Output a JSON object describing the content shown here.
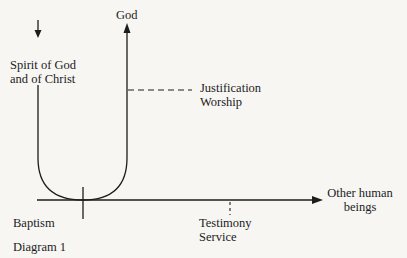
{
  "diagram": {
    "caption": "Diagram 1",
    "labels": {
      "top_arrow": "God",
      "down_arrow_line1": "Spirit of God",
      "down_arrow_line2": "and of Christ",
      "vertical_marker_line1": "Justification",
      "vertical_marker_line2": "Worship",
      "horizontal_arrow_line1": "Other human",
      "horizontal_arrow_line2": "beings",
      "origin_marker": "Baptism",
      "horizontal_marker_line1": "Testimony",
      "horizontal_marker_line2": "Service"
    },
    "colors": {
      "line": "#1c1c1c",
      "background": "#f7f6f3"
    }
  }
}
